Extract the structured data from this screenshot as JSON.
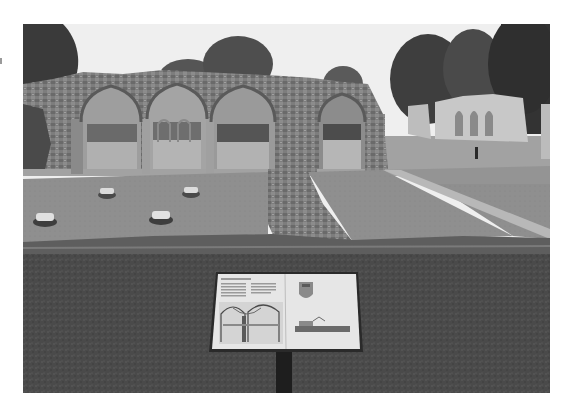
{
  "image": {
    "kind": "black-and-white photograph",
    "subject": "ruined gothic abbey arcade with lawns and an interpretive sign",
    "canvas": {
      "width": 572,
      "height": 415
    },
    "photo_bounds": {
      "x": 23,
      "y": 24,
      "width": 527,
      "height": 369
    }
  },
  "colors": {
    "page_bg": "#ffffff",
    "sky": "#efefef",
    "tree_dark": "#3a3a3a",
    "tree_mid": "#555555",
    "stone": "#7d7d7d",
    "stone_light": "#a9a9a9",
    "stone_pale": "#c8c8c8",
    "lawn_mid": "#8f8f8f",
    "lawn_fore": "#4a4a4a",
    "sign_panel": "#e6e6e6",
    "sign_frame": "#2a2a2a",
    "sign_post": "#1e1e1e"
  },
  "scene": {
    "arches": [
      {
        "name": "arch-1",
        "x": 58,
        "w": 62
      },
      {
        "name": "arch-2",
        "x": 124,
        "w": 60
      },
      {
        "name": "arch-3",
        "x": 188,
        "w": 64
      },
      {
        "name": "arch-4-doorway",
        "x": 296,
        "w": 46
      }
    ],
    "column_bases": [
      {
        "cx": 22,
        "cy": 195
      },
      {
        "cx": 84,
        "cy": 168
      },
      {
        "cx": 168,
        "cy": 167
      },
      {
        "cx": 138,
        "cy": 193
      }
    ],
    "sign": {
      "x": 186,
      "y": 248,
      "width": 152,
      "height": 80,
      "text_legible": false,
      "illustrations": [
        "vaulted-undercroft-drawing",
        "heraldic-crest",
        "building-elevation-drawing"
      ]
    }
  }
}
